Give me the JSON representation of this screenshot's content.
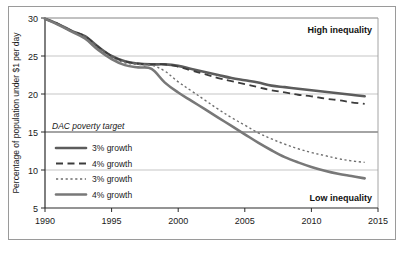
{
  "chart_data": {
    "type": "line",
    "title": "",
    "xlabel": "",
    "ylabel": "Percentage of population under $1 per day",
    "xlim": [
      1990,
      2015
    ],
    "ylim": [
      5,
      30
    ],
    "xticks": [
      1990,
      1995,
      2000,
      2005,
      2010,
      2015
    ],
    "yticks": [
      5,
      10,
      15,
      20,
      25,
      30
    ],
    "grid": true,
    "legend_position": "inside-left",
    "annotations": [
      {
        "name": "high-inequality",
        "text": "High inequality",
        "position": "top-right"
      },
      {
        "name": "low-inequality",
        "text": "Low inequality",
        "position": "bottom-right"
      },
      {
        "name": "dac-poverty-target",
        "text": "DAC poverty target",
        "value": 15,
        "position": "left-above-15-line"
      }
    ],
    "series": [
      {
        "name": "high-inequality-3pct-growth",
        "label": "3% growth",
        "group": "High inequality",
        "style": "solid-thick",
        "color": "#5c5c5c",
        "x": [
          1990,
          1991,
          1992,
          1993,
          1994,
          1995,
          1996,
          1997,
          1998,
          1999,
          2000,
          2001,
          2002,
          2003,
          2004,
          2005,
          2006,
          2007,
          2008,
          2009,
          2010,
          2011,
          2012,
          2013,
          2014
        ],
        "values": [
          29.9,
          29.2,
          28.3,
          27.6,
          26.2,
          25.0,
          24.3,
          24.0,
          23.9,
          23.9,
          23.7,
          23.3,
          22.9,
          22.5,
          22.1,
          21.8,
          21.5,
          21.1,
          20.9,
          20.7,
          20.5,
          20.3,
          20.1,
          19.9,
          19.7
        ]
      },
      {
        "name": "high-inequality-4pct-growth",
        "label": "4% growth",
        "group": "High inequality",
        "style": "dashed",
        "color": "#3c3c3c",
        "x": [
          1990,
          1991,
          1992,
          1993,
          1994,
          1995,
          1996,
          1997,
          1998,
          1999,
          2000,
          2001,
          2002,
          2003,
          2004,
          2005,
          2006,
          2007,
          2008,
          2009,
          2010,
          2011,
          2012,
          2013,
          2014
        ],
        "values": [
          29.9,
          29.2,
          28.3,
          27.6,
          26.2,
          25.0,
          24.3,
          24.0,
          23.9,
          23.9,
          23.6,
          23.1,
          22.6,
          22.1,
          21.7,
          21.3,
          20.9,
          20.5,
          20.2,
          19.9,
          19.7,
          19.4,
          19.2,
          18.9,
          18.7
        ]
      },
      {
        "name": "low-inequality-3pct-growth",
        "label": "3% growth",
        "group": "Low inequality",
        "style": "dotted",
        "color": "#6e6e6e",
        "x": [
          1990,
          1991,
          1992,
          1993,
          1994,
          1995,
          1996,
          1997,
          1998,
          1999,
          2000,
          2001,
          2002,
          2003,
          2004,
          2005,
          2006,
          2007,
          2008,
          2009,
          2010,
          2011,
          2012,
          2013,
          2014
        ],
        "values": [
          29.9,
          29.2,
          28.3,
          27.4,
          26.0,
          24.8,
          24.1,
          23.9,
          23.8,
          23.0,
          21.6,
          20.4,
          19.2,
          18.0,
          16.9,
          15.9,
          14.9,
          14.1,
          13.4,
          12.8,
          12.3,
          11.9,
          11.5,
          11.2,
          11.0
        ]
      },
      {
        "name": "low-inequality-4pct-growth",
        "label": "4% growth",
        "group": "Low inequality",
        "style": "solid-thick",
        "color": "#787878",
        "x": [
          1990,
          1991,
          1992,
          1993,
          1994,
          1995,
          1996,
          1997,
          1998,
          1999,
          2000,
          2001,
          2002,
          2003,
          2004,
          2005,
          2006,
          2007,
          2008,
          2009,
          2010,
          2011,
          2012,
          2013,
          2014
        ],
        "values": [
          29.9,
          29.1,
          28.2,
          27.3,
          25.8,
          24.6,
          23.8,
          23.5,
          23.3,
          21.5,
          20.2,
          19.1,
          18.0,
          16.9,
          15.8,
          14.7,
          13.6,
          12.6,
          11.7,
          11.0,
          10.4,
          9.9,
          9.5,
          9.2,
          8.9
        ]
      }
    ]
  },
  "axis": {
    "y_title": "Percentage of population under $1 per day",
    "y_ticks": [
      "30",
      "25",
      "20",
      "15",
      "10",
      "5"
    ],
    "x_ticks": [
      "1990",
      "1995",
      "2000",
      "2005",
      "2010",
      "2015"
    ]
  },
  "labels": {
    "high_inequality": "High inequality",
    "low_inequality": "Low inequality",
    "dac_poverty_target": "DAC poverty target"
  },
  "legend": {
    "items": [
      {
        "label": "3% growth",
        "style": "solid-thick",
        "color": "#5c5c5c"
      },
      {
        "label": "4% growth",
        "style": "dashed",
        "color": "#3c3c3c"
      },
      {
        "label": "3% growth",
        "style": "dotted",
        "color": "#6e6e6e"
      },
      {
        "label": "4% growth",
        "style": "solid-thick",
        "color": "#787878"
      }
    ]
  },
  "colors": {
    "frame": "#9a9a9a",
    "axis": "#2a2a2a",
    "grid": "#b6b6b6",
    "target_line": "#4a4a4a",
    "background": "#ffffff"
  }
}
